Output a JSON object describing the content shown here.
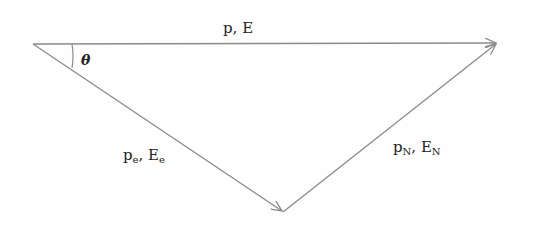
{
  "diagram": {
    "type": "vector-triangle",
    "vertices": {
      "left": [
        33,
        44
      ],
      "right": [
        497,
        43
      ],
      "bottom": [
        283,
        212
      ]
    },
    "colors": {
      "line": "#8a8a8a",
      "text": "#222222",
      "background": "#fefefe"
    },
    "vectors": [
      {
        "id": "incident",
        "from": "left",
        "to": "right",
        "label_main": "p, E",
        "label_base_p": "p",
        "label_base_E": "E",
        "label_sub": ""
      },
      {
        "id": "electron",
        "from": "left",
        "to": "bottom",
        "label_p": "p",
        "label_E": "E",
        "label_sub": "e"
      },
      {
        "id": "nucleus",
        "from": "bottom",
        "to": "right",
        "label_p": "p",
        "label_E": "E",
        "label_sub": "N"
      }
    ],
    "angle": {
      "symbol": "θ",
      "at": "left"
    }
  }
}
